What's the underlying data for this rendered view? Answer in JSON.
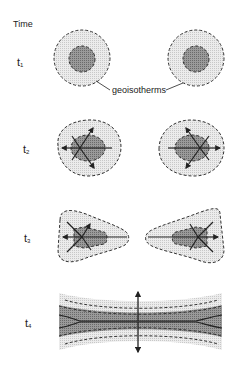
{
  "diagram": {
    "axis_label": "Time",
    "annotation": "geoisotherms",
    "stages": [
      {
        "label": "t",
        "subscript": "1",
        "description": "two separate concentric circular bodies"
      },
      {
        "label": "t",
        "subscript": "2",
        "description": "bodies spreading with outward arrows"
      },
      {
        "label": "t",
        "subscript": "3",
        "description": "bodies elongating toward each other"
      },
      {
        "label": "t",
        "subscript": "4",
        "description": "merged band with vertical extension arrows"
      }
    ],
    "colors": {
      "outer_fill": "#e6e6e6",
      "inner_fill": "#8a8a8a",
      "stroke": "#333333",
      "background": "#ffffff"
    }
  }
}
